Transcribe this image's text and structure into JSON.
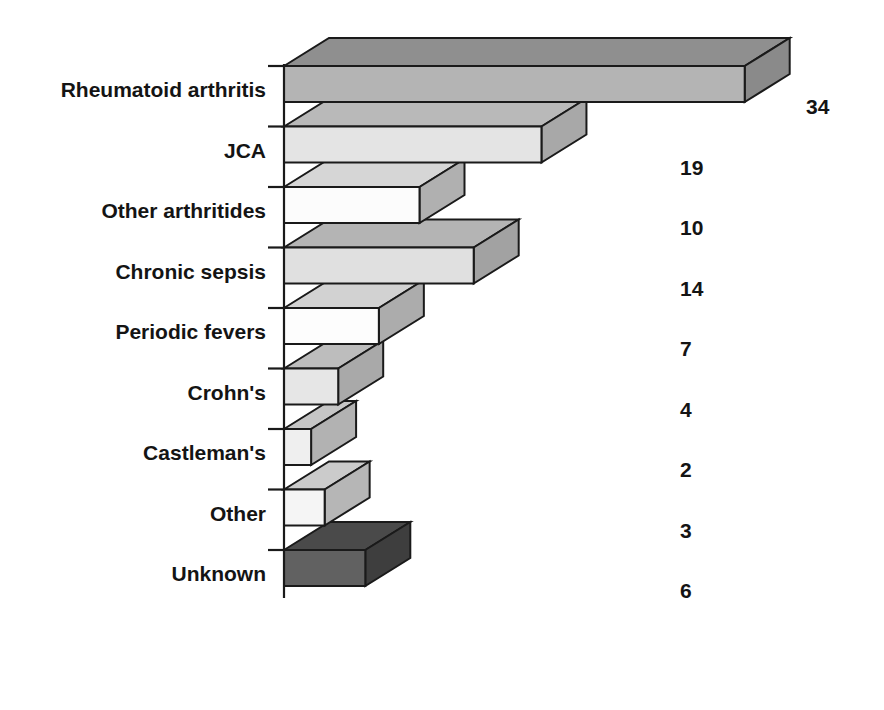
{
  "chart_data": {
    "type": "bar",
    "title": "",
    "subtitle": "",
    "xlabel": "",
    "ylabel": "",
    "orientation": "horizontal",
    "three_d": true,
    "grid": false,
    "legend": "none",
    "xlim": [
      0,
      34
    ],
    "categories": [
      "Rheumatoid arthritis",
      "JCA",
      "Other arthritides",
      "Chronic sepsis",
      "Periodic fevers",
      "Crohn's",
      "Castleman's",
      "Other",
      "Unknown"
    ],
    "values": [
      34,
      19,
      10,
      14,
      7,
      4,
      2,
      3,
      6
    ],
    "value_labels": [
      "34",
      "19",
      "10",
      "14",
      "7",
      "4",
      "2",
      "3",
      "6"
    ],
    "bar_colors_front": [
      "#b4b4b4",
      "#e4e4e4",
      "#fcfcfc",
      "#e0e0e0",
      "#fdfdfd",
      "#e6e6e6",
      "#efefef",
      "#f5f5f5",
      "#616161"
    ],
    "bar_colors_top": [
      "#8f8f8f",
      "#b9b9b9",
      "#d6d6d6",
      "#b4b4b4",
      "#d2d2d2",
      "#bdbdbd",
      "#c6c6c6",
      "#cbcbcb",
      "#4a4a4a"
    ],
    "bar_colors_side": [
      "#8a8a8a",
      "#a8a8a8",
      "#b0b0b0",
      "#a2a2a2",
      "#acacac",
      "#a9a9a9",
      "#b2b2b2",
      "#b6b6b6",
      "#3e3e3e"
    ],
    "outline_color": "#1a1a1a",
    "background_color": "#ffffff",
    "text_color": "#141414"
  }
}
